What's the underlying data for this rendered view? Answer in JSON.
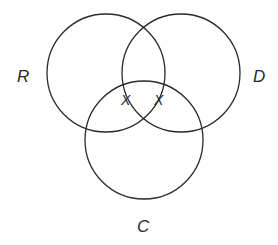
{
  "diagram": {
    "type": "venn",
    "sets": [
      {
        "id": "R",
        "label": "R",
        "cx": 106,
        "cy": 73,
        "r": 59
      },
      {
        "id": "D",
        "label": "D",
        "cx": 181,
        "cy": 73,
        "r": 59
      },
      {
        "id": "C",
        "label": "C",
        "cx": 144,
        "cy": 140,
        "r": 59
      }
    ],
    "labels": {
      "R": "R",
      "D": "D",
      "C": "C"
    },
    "marks": [
      {
        "symbol": "X",
        "region": "R∩C (not D)"
      },
      {
        "symbol": "X",
        "region": "D∩C (not R)"
      }
    ],
    "stroke_color": "#2a2a2a"
  }
}
